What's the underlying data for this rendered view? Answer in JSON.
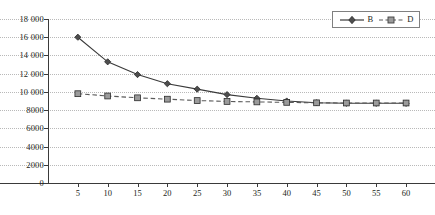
{
  "chart_data": {
    "type": "line",
    "title": "",
    "xlabel": "",
    "ylabel": "",
    "x": [
      5,
      10,
      15,
      20,
      25,
      30,
      35,
      40,
      45,
      50,
      55,
      60
    ],
    "xlim": [
      0,
      62.5
    ],
    "ylim": [
      0,
      18000
    ],
    "y_ticks": [
      0,
      2000,
      4000,
      6000,
      8000,
      10000,
      12000,
      14000,
      16000,
      18000
    ],
    "y_tick_labels": [
      "0",
      "2000",
      "4000",
      "6000",
      "8000",
      "10 000",
      "12 000",
      "14 000",
      "16 000",
      "18 000"
    ],
    "x_tick_labels": [
      "5",
      "10",
      "15",
      "20",
      "25",
      "30",
      "35",
      "40",
      "45",
      "50",
      "55",
      "60"
    ],
    "grid": "horizontal-dotted",
    "legend_position": "top-right",
    "series": [
      {
        "name": "B",
        "values": [
          16000,
          13300,
          11900,
          10900,
          10300,
          9700,
          9300,
          9000,
          8800,
          8750,
          8750,
          8750
        ],
        "line_style": "solid",
        "marker": "diamond",
        "color": "#3a3a3a",
        "marker_fill": "#4d4d4d"
      },
      {
        "name": "D",
        "values": [
          9800,
          9550,
          9350,
          9200,
          9050,
          8950,
          8900,
          8850,
          8800,
          8780,
          8780,
          8780
        ],
        "line_style": "dashed",
        "marker": "square",
        "color": "#5a5a5a",
        "marker_fill": "#9b9b9b"
      }
    ]
  },
  "legend": {
    "entries": [
      {
        "label": "B"
      },
      {
        "label": "D"
      }
    ]
  },
  "colors": {
    "axis": "#3a3a3a",
    "grid": "#b9b9b9",
    "text": "#231f20",
    "legend_border": "#808080",
    "series_b": "#3a3a3a",
    "series_d": "#5a5a5a",
    "marker_b_fill": "#4d4d4d",
    "marker_d_fill": "#9b9b9b"
  }
}
